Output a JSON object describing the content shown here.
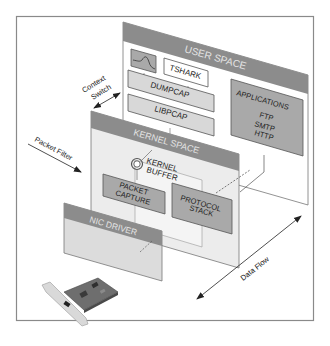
{
  "diagram": {
    "type": "layered-architecture",
    "colors": {
      "frame": "#8a8a8a",
      "panel_header": "#8c8c8c",
      "panel_body": "#f2f2f2",
      "panel_body_light": "#e9e9e9",
      "box_gray": "#a9a9a9",
      "box_light": "#d8d8d8",
      "box_white": "#ffffff",
      "line": "#555555",
      "header_text": "#e4e4e4",
      "text": "#222222"
    },
    "layers": {
      "user_space": {
        "title": "USER SPACE",
        "boxes": {
          "wireshark_icon": "wireshark-graph-icon",
          "tshark": "TSHARK",
          "dumpcap": "DUMPCAP",
          "libpcap": "LIBPCAP",
          "applications": {
            "title": "APPLICATIONS",
            "items": [
              "FTP",
              "SMTP",
              "HTTP"
            ]
          }
        }
      },
      "kernel_space": {
        "title": "KERNEL SPACE",
        "boxes": {
          "kernel_buffer": [
            "KERNEL",
            "BUFFER"
          ],
          "packet_capture": [
            "PACKET",
            "CAPTURE"
          ],
          "protocol_stack": [
            "PROTOCOL",
            "STACK"
          ]
        }
      },
      "nic_driver": {
        "title": "NIC DRIVER"
      }
    },
    "annotations": {
      "context_switch": [
        "Context",
        "Switch"
      ],
      "packet_filter": "Packet Filter",
      "data_flow": "Data Flow"
    },
    "image": "network-interface-card"
  }
}
